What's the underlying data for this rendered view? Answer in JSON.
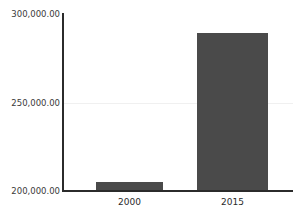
{
  "chart_data": {
    "type": "bar",
    "title": "",
    "subtitle": "",
    "xlabel": "",
    "ylabel": "",
    "categories": [
      "2000",
      "2015"
    ],
    "values": [
      205000,
      289500
    ],
    "ylim": [
      200000,
      300000
    ],
    "yticks": [
      200000,
      250000,
      300000
    ],
    "ytick_labels": [
      "200,000.00",
      "250,000.00",
      "300,000.00"
    ],
    "grid": true,
    "legend": false,
    "legend_position": "none",
    "series": [
      {
        "name": "",
        "values": [
          205000,
          289500
        ],
        "color": "#4a4a4a"
      }
    ]
  },
  "axis": {
    "y_labels": {
      "top": "300,000.00",
      "middle": "250,000.00",
      "bottom": "200,000.00"
    },
    "x_labels": {
      "first": "2000",
      "second": "2015"
    }
  },
  "colors": {
    "bar_fill": "#4a4a4a",
    "axis_line": "#2b2b2b",
    "gridline": "#f0f0f0",
    "plot_background": "#ffffff",
    "tick_text": "#3a3a3a"
  }
}
